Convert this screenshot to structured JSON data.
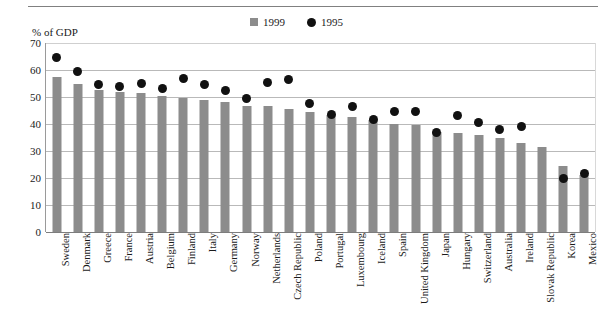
{
  "chart_data": {
    "type": "bar",
    "title": "",
    "subtitle": "",
    "ylabel": "% of GDP",
    "xlabel": "",
    "ylim": [
      0,
      70
    ],
    "yticks": [
      0,
      10,
      20,
      30,
      40,
      50,
      60,
      70
    ],
    "ytick_labels": [
      "0",
      "10",
      "20",
      "30",
      "40",
      "50",
      "60",
      "70"
    ],
    "grid": true,
    "legend_position": "top-center",
    "categories": [
      "Sweden",
      "Denmark",
      "Greece",
      "France",
      "Austria",
      "Belgium",
      "Finland",
      "Italy",
      "Germany",
      "Norway",
      "Netherlands",
      "Czech Republic",
      "Poland",
      "Portugal",
      "Luxembourg",
      "Iceland",
      "Spain",
      "United Kingdom",
      "Japan",
      "Hungary",
      "Switzerland",
      "Australia",
      "Ireland",
      "Slovak Republic",
      "Korea",
      "Mexico"
    ],
    "series": [
      {
        "name": "1999",
        "marker": "bar",
        "color": "#8c8c8c",
        "values": [
          57.5,
          55.0,
          52.5,
          52.0,
          51.5,
          50.5,
          49.5,
          49.0,
          48.0,
          46.5,
          46.5,
          45.5,
          44.5,
          43.5,
          42.5,
          41.5,
          40.0,
          39.5,
          37.0,
          36.5,
          36.0,
          35.0,
          33.0,
          31.5,
          24.5,
          21.0
        ]
      },
      {
        "name": "1995",
        "marker": "circle",
        "color": "#111111",
        "values": [
          64.5,
          59.5,
          54.5,
          54.0,
          55.0,
          53.0,
          57.0,
          54.5,
          52.5,
          49.5,
          55.5,
          56.5,
          47.5,
          43.5,
          46.5,
          41.5,
          44.5,
          44.5,
          37.0,
          43.0,
          40.5,
          38.0,
          39.0,
          null,
          20.0,
          21.5
        ]
      }
    ]
  },
  "legend": {
    "entries": [
      {
        "label": "1999",
        "marker": "square",
        "color": "#8c8c8c"
      },
      {
        "label": "1995",
        "marker": "circle",
        "color": "#111111"
      }
    ]
  }
}
